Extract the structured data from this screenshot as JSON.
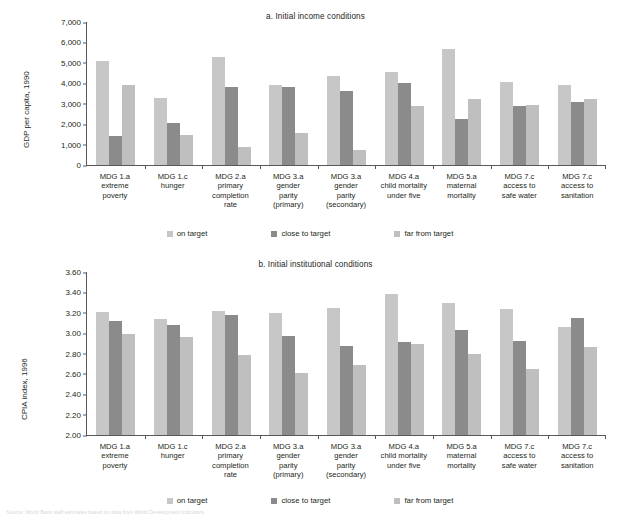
{
  "source_note": "Source: World Bank staff estimates based on data from World Development Indicators.",
  "legend": {
    "items": [
      {
        "key": "on",
        "label": "on target"
      },
      {
        "key": "close",
        "label": "close to target"
      },
      {
        "key": "far",
        "label": "far from target"
      }
    ]
  },
  "colors": {
    "on_target": "#c7c7c7",
    "close_to_target": "#8b8b8b",
    "far_from_target": "#bfbfbf",
    "axis": "#58585b",
    "text": "#231f20"
  },
  "chart_data": [
    {
      "id": "a",
      "type": "bar",
      "title": "a.  Initial income conditions",
      "ylabel": "GDP per capita, 1990",
      "xlabel": "",
      "ylim": [
        0,
        7000
      ],
      "yticks": [
        "0",
        "1,000",
        "2,000",
        "3,000",
        "4,000",
        "5,000",
        "6,000",
        "7,000"
      ],
      "ytick_values": [
        0,
        1000,
        2000,
        3000,
        4000,
        5000,
        6000,
        7000
      ],
      "grid": false,
      "legend_position": "bottom",
      "categories": [
        "MDG 1.a extreme poverty",
        "MDG 1.c hunger",
        "MDG 2.a primary completion rate",
        "MDG 3.a gender parity (primary)",
        "MDG 3.a gender parity (secondary)",
        "MDG 4.a child mortality under five",
        "MDG 5.a maternal mortality",
        "MDG 7.c access to safe water",
        "MDG 7.c access to sanitation"
      ],
      "category_lines": [
        [
          "MDG 1.a",
          "extreme",
          "poverty"
        ],
        [
          "MDG 1.c",
          "hunger"
        ],
        [
          "MDG 2.a",
          "primary",
          "completion",
          "rate"
        ],
        [
          "MDG 3.a",
          "gender",
          "parity",
          "(primary)"
        ],
        [
          "MDG 3.a",
          "gender",
          "parity",
          "(secondary)"
        ],
        [
          "MDG 4.a",
          "child mortality",
          "under five"
        ],
        [
          "MDG 5.a",
          "maternal",
          "mortality"
        ],
        [
          "MDG 7.c",
          "access to",
          "safe water"
        ],
        [
          "MDG 7.c",
          "access to",
          "sanitation"
        ]
      ],
      "series": [
        {
          "name": "on target",
          "key": "on",
          "values": [
            5080,
            3270,
            5280,
            3930,
            4370,
            4570,
            5700,
            4060,
            3930
          ]
        },
        {
          "name": "close to target",
          "key": "close",
          "values": [
            1400,
            2050,
            3810,
            3800,
            3600,
            4000,
            2230,
            2880,
            3070
          ]
        },
        {
          "name": "far from target",
          "key": "far",
          "values": [
            3920,
            1490,
            880,
            1560,
            720,
            2890,
            3230,
            2920,
            3210
          ]
        }
      ]
    },
    {
      "id": "b",
      "type": "bar",
      "title": "b. Initial institutional conditions",
      "ylabel": "CPIA index, 1996",
      "xlabel": "",
      "ylim": [
        2.0,
        3.6
      ],
      "yticks": [
        "2.00",
        "2.20",
        "2.40",
        "2.60",
        "2.80",
        "3.00",
        "3.20",
        "3.40",
        "3.60"
      ],
      "ytick_values": [
        2.0,
        2.2,
        2.4,
        2.6,
        2.8,
        3.0,
        3.2,
        3.4,
        3.6
      ],
      "grid": false,
      "legend_position": "bottom",
      "categories": [
        "MDG 1.a extreme poverty",
        "MDG 1.c hunger",
        "MDG 2.a primary completion rate",
        "MDG 3.a gender parity (primary)",
        "MDG 3.a gender parity (secondary)",
        "MDG 4.a child mortality under five",
        "MDG 5.a maternal mortality",
        "MDG 7.c access to safe water",
        "MDG 7.c access to sanitation"
      ],
      "category_lines": [
        [
          "MDG 1.a",
          "extreme",
          "poverty"
        ],
        [
          "MDG 1.c",
          "hunger"
        ],
        [
          "MDG 2.a",
          "primary",
          "completion",
          "rate"
        ],
        [
          "MDG 3.a",
          "gender",
          "parity",
          "(primary)"
        ],
        [
          "MDG 3.a",
          "gender",
          "parity",
          "(secondary)"
        ],
        [
          "MDG 4.a",
          "child mortality",
          "under five"
        ],
        [
          "MDG 5.a",
          "maternal",
          "mortality"
        ],
        [
          "MDG 7.c",
          "access to",
          "safe water"
        ],
        [
          "MDG 7.c",
          "access to",
          "sanitation"
        ]
      ],
      "series": [
        {
          "name": "on target",
          "key": "on",
          "values": [
            3.21,
            3.14,
            3.22,
            3.2,
            3.25,
            3.38,
            3.3,
            3.24,
            3.06
          ]
        },
        {
          "name": "close to target",
          "key": "close",
          "values": [
            3.12,
            3.08,
            3.18,
            2.97,
            2.87,
            2.91,
            3.03,
            2.92,
            3.15
          ]
        },
        {
          "name": "far from target",
          "key": "far",
          "values": [
            2.99,
            2.96,
            2.79,
            2.61,
            2.69,
            2.89,
            2.8,
            2.65,
            2.86
          ]
        }
      ]
    }
  ]
}
